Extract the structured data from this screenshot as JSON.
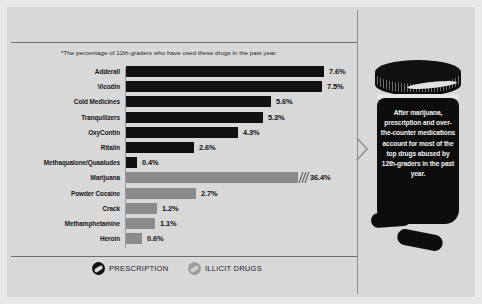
{
  "subtitle": "*The percentage of 12th-graders who have used these drugs in the past year.",
  "colors": {
    "prescription": "#111111",
    "illicit": "#8b8b8b",
    "background": "#d8d8d8",
    "frame": "#e9e9e9"
  },
  "legend": {
    "items": [
      {
        "label": "PRESCRIPTION",
        "type": "prescription",
        "icon": "pill-icon"
      },
      {
        "label": "ILLICIT DRUGS",
        "type": "illicit",
        "icon": "pill-icon"
      }
    ]
  },
  "callout": {
    "text": "After marijuana, prescription and over-the-counter medications account for most of the top drugs abused by 12th-graders in the past year."
  },
  "chart_data": {
    "type": "bar",
    "orientation": "horizontal",
    "title": "",
    "subtitle": "*The percentage of 12th-graders who have used these drugs in the past year.",
    "xlabel": "",
    "ylabel": "",
    "xlim": [
      0,
      8
    ],
    "axis_break": true,
    "axis_break_note": "Marijuana bar is truncated with break marks; true value 36.4%",
    "grid": false,
    "legend_position": "bottom",
    "categories": [
      "Adderall",
      "Vicodin",
      "Cold Medicines",
      "Tranquilizers",
      "OxyContin",
      "Ritalin",
      "Methaqualone/Quaaludes",
      "Marijuana",
      "Powder Cocaine",
      "Crack",
      "Methamphetamine",
      "Heroin"
    ],
    "values": [
      7.6,
      7.5,
      5.6,
      5.3,
      4.3,
      2.6,
      0.4,
      36.4,
      2.7,
      1.2,
      1.1,
      0.6
    ],
    "value_labels": [
      "7.6%",
      "7.5%",
      "5.6%",
      "5.3%",
      "4.3%",
      "2.6%",
      "0.4%",
      "36.4%",
      "2.7%",
      "1.2%",
      "1.1%",
      "0.6%"
    ],
    "series_group": [
      "prescription",
      "prescription",
      "prescription",
      "prescription",
      "prescription",
      "prescription",
      "prescription",
      "illicit",
      "illicit",
      "illicit",
      "illicit",
      "illicit"
    ],
    "bar_pixel_widths": [
      198,
      196,
      145,
      137,
      112,
      68,
      11,
      172,
      70,
      31,
      29,
      16
    ],
    "legend": [
      "PRESCRIPTION",
      "ILLICIT DRUGS"
    ]
  },
  "rows": [
    {
      "label": "Adderall",
      "value": "7.6%",
      "width": 198,
      "group": "rx",
      "broken": false
    },
    {
      "label": "Vicodin",
      "value": "7.5%",
      "width": 196,
      "group": "rx",
      "broken": false
    },
    {
      "label": "Cold Medicines",
      "value": "5.6%",
      "width": 145,
      "group": "rx",
      "broken": false
    },
    {
      "label": "Tranquilizers",
      "value": "5.3%",
      "width": 137,
      "group": "rx",
      "broken": false
    },
    {
      "label": "OxyContin",
      "value": "4.3%",
      "width": 112,
      "group": "rx",
      "broken": false
    },
    {
      "label": "Ritalin",
      "value": "2.6%",
      "width": 68,
      "group": "rx",
      "broken": false
    },
    {
      "label": "Methaqualone/Quaaludes",
      "value": "0.4%",
      "width": 11,
      "group": "rx",
      "broken": false
    },
    {
      "label": "Marijuana",
      "value": "36.4%",
      "width": 172,
      "group": "illicit",
      "broken": true
    },
    {
      "label": "Powder Cocaine",
      "value": "2.7%",
      "width": 70,
      "group": "illicit",
      "broken": false
    },
    {
      "label": "Crack",
      "value": "1.2%",
      "width": 31,
      "group": "illicit",
      "broken": false
    },
    {
      "label": "Methamphetamine",
      "value": "1.1%",
      "width": 29,
      "group": "illicit",
      "broken": false
    },
    {
      "label": "Heroin",
      "value": "0.6%",
      "width": 16,
      "group": "illicit",
      "broken": false
    }
  ]
}
